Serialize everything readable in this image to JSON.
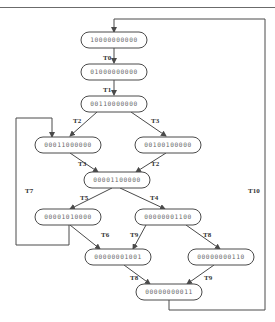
{
  "diagram": {
    "type": "state-transition-graph",
    "colors": {
      "stroke": "#4a4a4a",
      "text": "#6a6a6a",
      "label": "#333333",
      "background": "#ffffff"
    },
    "nodes": [
      {
        "id": "n0",
        "label": "10000000000",
        "x": 114,
        "y": 40,
        "w": 66,
        "h": 16
      },
      {
        "id": "n1",
        "label": "01000000000",
        "x": 114,
        "y": 72,
        "w": 66,
        "h": 16
      },
      {
        "id": "n2",
        "label": "00110000000",
        "x": 114,
        "y": 104,
        "w": 66,
        "h": 16
      },
      {
        "id": "n3",
        "label": "00011000000",
        "x": 68,
        "y": 145,
        "w": 66,
        "h": 16
      },
      {
        "id": "n4",
        "label": "00100100000",
        "x": 168,
        "y": 145,
        "w": 66,
        "h": 16
      },
      {
        "id": "n5",
        "label": "00001100000",
        "x": 117,
        "y": 180,
        "w": 66,
        "h": 16
      },
      {
        "id": "n6",
        "label": "00001010000",
        "x": 68,
        "y": 217,
        "w": 66,
        "h": 16
      },
      {
        "id": "n7",
        "label": "00000001100",
        "x": 168,
        "y": 217,
        "w": 66,
        "h": 16
      },
      {
        "id": "n8",
        "label": "00000001001",
        "x": 118,
        "y": 257,
        "w": 66,
        "h": 16
      },
      {
        "id": "n9",
        "label": "00000000110",
        "x": 221,
        "y": 257,
        "w": 66,
        "h": 16
      },
      {
        "id": "n10",
        "label": "00000000011",
        "x": 169,
        "y": 292,
        "w": 66,
        "h": 16
      }
    ],
    "edges": [
      {
        "label": "T0",
        "from": "n0",
        "to": "n1",
        "lx": 103,
        "ly": 60
      },
      {
        "label": "T1",
        "from": "n1",
        "to": "n2",
        "lx": 103,
        "ly": 92
      },
      {
        "label": "T2",
        "from": "n2",
        "to": "n3",
        "lx": 73,
        "ly": 123
      },
      {
        "label": "T3",
        "from": "n2",
        "to": "n4",
        "lx": 151,
        "ly": 123
      },
      {
        "label": "T3",
        "from": "n3",
        "to": "n5",
        "lx": 78,
        "ly": 166
      },
      {
        "label": "T2",
        "from": "n4",
        "to": "n5",
        "lx": 151,
        "ly": 166
      },
      {
        "label": "T5",
        "from": "n5",
        "to": "n6",
        "lx": 80,
        "ly": 200
      },
      {
        "label": "T4",
        "from": "n5",
        "to": "n7",
        "lx": 150,
        "ly": 200
      },
      {
        "label": "T6",
        "from": "n6",
        "to": "n8",
        "lx": 101,
        "ly": 237
      },
      {
        "label": "T9",
        "from": "n7",
        "to": "n8",
        "lx": 130,
        "ly": 237
      },
      {
        "label": "T8",
        "from": "n7",
        "to": "n9",
        "lx": 203,
        "ly": 237
      },
      {
        "label": "T8",
        "from": "n8",
        "to": "n10",
        "lx": 130,
        "ly": 280
      },
      {
        "label": "T9",
        "from": "n9",
        "to": "n10",
        "lx": 204,
        "ly": 280
      },
      {
        "label": "T7",
        "from": "n6",
        "to": "n3",
        "lx": 25,
        "ly": 193
      },
      {
        "label": "T10",
        "from": "n10",
        "to": "n0",
        "lx": 248,
        "ly": 193
      }
    ]
  }
}
